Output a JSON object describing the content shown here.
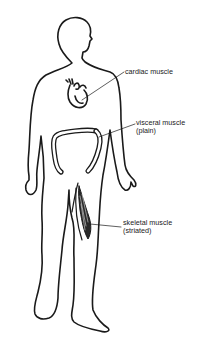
{
  "diagram": {
    "colors": {
      "background": "#ffffff",
      "stroke": "#1a1a1a",
      "text": "#1a1a1a"
    },
    "labels": [
      {
        "id": "cardiac",
        "line1": "cardiac muscle",
        "line2": ""
      },
      {
        "id": "visceral",
        "line1": "visceral muscle",
        "line2": "(plain)"
      },
      {
        "id": "skeletal",
        "line1": "skeletal muscle",
        "line2": "(striated)"
      }
    ]
  }
}
